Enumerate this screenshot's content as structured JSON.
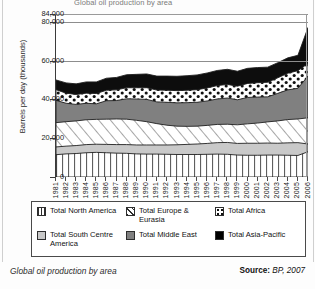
{
  "figure": {
    "clipped_title": "Global oil production by area",
    "caption": "Global oil production by area",
    "source_label": "Source:",
    "source_value": "BP, 2007"
  },
  "legend": {
    "items": [
      {
        "label": "Total North America",
        "pattern": "vertical-lines",
        "color": "#ffffff"
      },
      {
        "label": "Total Europe & Eurasia",
        "pattern": "diagonal-hatch",
        "color": "#ffffff"
      },
      {
        "label": "Total Africa",
        "pattern": "dots",
        "color": "#ffffff"
      },
      {
        "label": "Total South Centre America",
        "pattern": "solid",
        "color": "#c8c8c8"
      },
      {
        "label": "Total Middle East",
        "pattern": "solid",
        "color": "#808080"
      },
      {
        "label": "Total Asia-Pacific",
        "pattern": "solid",
        "color": "#000000"
      }
    ]
  },
  "chart_data": {
    "type": "area",
    "stacked": true,
    "title": "Global oil production by area",
    "xlabel": "",
    "ylabel": "Barrels per day (thousands)",
    "ylim": [
      0,
      84000
    ],
    "yticks": [
      0,
      20000,
      40000,
      60000,
      80000,
      84000
    ],
    "ytick_labels": [
      "0",
      "20,000",
      "40,000",
      "60,000",
      "80,000",
      "84,000"
    ],
    "gridlines": [
      60000,
      80000,
      84000
    ],
    "grid": true,
    "legend_position": "below-plot",
    "x": [
      1981,
      1982,
      1983,
      1984,
      1985,
      1986,
      1987,
      1988,
      1989,
      1990,
      1991,
      1992,
      1993,
      1994,
      1995,
      1996,
      1997,
      1998,
      1999,
      2000,
      2001,
      2002,
      2003,
      2004,
      2005,
      2006
    ],
    "categories": [
      "1981",
      "1982",
      "1983",
      "1984",
      "1985",
      "1986",
      "1987",
      "1988",
      "1989",
      "1990",
      "1991",
      "1992",
      "1993",
      "1994",
      "1995",
      "1996",
      "1997",
      "1998",
      "1999",
      "2000",
      "2001",
      "2002",
      "2003",
      "2004",
      "2005",
      "2006"
    ],
    "series": [
      {
        "name": "Total North America",
        "pattern": "vertical-lines",
        "values": [
          11500,
          11900,
          12100,
          12500,
          12700,
          12500,
          12300,
          12200,
          11900,
          11800,
          11800,
          11700,
          11600,
          11600,
          11600,
          11700,
          11800,
          11700,
          11300,
          11200,
          11200,
          11300,
          11300,
          11200,
          11100,
          13000
        ]
      },
      {
        "name": "Total South Centre America",
        "pattern": "solid-light-gray",
        "values": [
          4000,
          4000,
          4100,
          4200,
          4200,
          4300,
          4400,
          4500,
          4600,
          4700,
          4700,
          4800,
          5000,
          5200,
          5400,
          5600,
          5900,
          6100,
          6000,
          6200,
          6200,
          6200,
          6100,
          6400,
          6600,
          4000
        ]
      },
      {
        "name": "Total Europe & Eurasia",
        "pattern": "diagonal-hatch",
        "values": [
          12500,
          12600,
          12700,
          12800,
          12800,
          13000,
          13200,
          13100,
          12700,
          12000,
          11000,
          10200,
          9600,
          9300,
          9200,
          9300,
          9400,
          9400,
          9600,
          10000,
          10400,
          10900,
          11500,
          12000,
          12200,
          13500
        ]
      },
      {
        "name": "Total Middle East",
        "pattern": "solid-gray",
        "values": [
          11500,
          9500,
          8500,
          8500,
          8000,
          9500,
          9500,
          10500,
          11000,
          11500,
          11200,
          11800,
          12000,
          12200,
          12300,
          12600,
          13100,
          13500,
          12900,
          13600,
          13400,
          12900,
          14200,
          15300,
          15800,
          21500
        ]
      },
      {
        "name": "Total Africa",
        "pattern": "dots",
        "values": [
          5500,
          5200,
          5100,
          5200,
          5300,
          5400,
          5500,
          5700,
          5800,
          6000,
          6100,
          6200,
          6300,
          6400,
          6500,
          6700,
          6900,
          7000,
          7000,
          7200,
          7400,
          7500,
          8000,
          8600,
          9100,
          6500
        ]
      },
      {
        "name": "Total Asia-Pacific",
        "pattern": "solid-black",
        "values": [
          5000,
          5300,
          5500,
          5800,
          6000,
          6200,
          6400,
          6700,
          6900,
          7100,
          7200,
          7300,
          7400,
          7500,
          7600,
          7700,
          7800,
          7800,
          7700,
          7800,
          7800,
          7800,
          7800,
          7900,
          7900,
          18500
        ]
      }
    ],
    "totals": [
      50000,
      48500,
      48000,
      49000,
      49000,
      50900,
      51300,
      52700,
      52900,
      53100,
      52000,
      52000,
      51900,
      52200,
      52600,
      53600,
      54900,
      55500,
      54500,
      56000,
      56400,
      56600,
      58900,
      61400,
      62700,
      77000
    ]
  }
}
